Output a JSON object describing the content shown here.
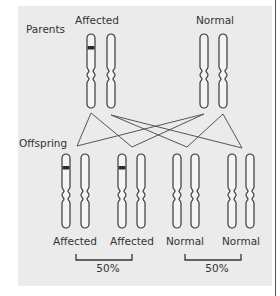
{
  "labels": {
    "parents": "Parents",
    "offspring": "Offspring",
    "parent_affected": "Affected",
    "parent_normal": "Normal"
  },
  "offspring": [
    {
      "label": "Affected",
      "has_band": true
    },
    {
      "label": "Affected",
      "has_band": true
    },
    {
      "label": "Normal",
      "has_band": false
    },
    {
      "label": "Normal",
      "has_band": false
    }
  ],
  "groups": [
    {
      "name": "affected",
      "percent": "50%"
    },
    {
      "name": "normal",
      "percent": "50%"
    }
  ],
  "colors": {
    "panel": "#ebebeb",
    "outline": "#3a3a3a",
    "band": "#2a2a2a",
    "lines": "#555555"
  }
}
